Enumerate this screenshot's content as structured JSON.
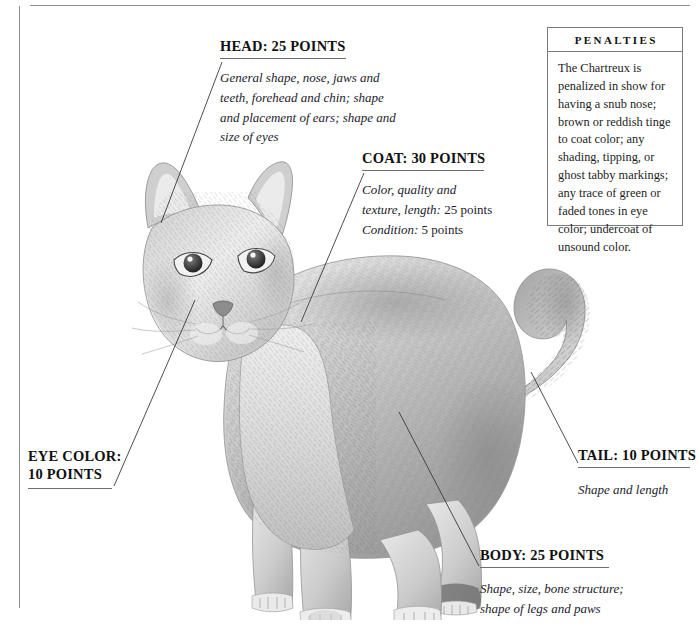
{
  "page": {
    "illustration_label": "chartreux-cat-drawing"
  },
  "callouts": [
    {
      "id": "head",
      "title": "HEAD: 25 POINTS",
      "body": "General shape, nose, jaws and teeth, forehead and chin; shape and placement of ears; shape and size of eyes"
    },
    {
      "id": "coat",
      "title": "COAT: 30 POINTS",
      "body_line1": "Color, quality and",
      "body_line2_italic": "texture, length:",
      "body_line2_upright": " 25 points",
      "body_line3_italic": "Condition:",
      "body_line3_upright": " 5 points"
    },
    {
      "id": "eye-color",
      "title_line1": "EYE COLOR:",
      "title_line2": "10 POINTS"
    },
    {
      "id": "tail",
      "title": "TAIL: 10 POINTS",
      "body": "Shape and length"
    },
    {
      "id": "body",
      "title": "BODY: 25 POINTS",
      "body_line1": "Shape, size, bone structure;",
      "body_line2": "shape of legs and paws"
    }
  ],
  "penalties": {
    "heading": "PENALTIES",
    "text": "The Chartreux is penalized in show for having a snub nose; brown or reddish tinge to coat color; any shading, tipping, or ghost tabby markings; any trace of green or faded tones in eye color; undercoat of unsound color."
  },
  "colors": {
    "rule": "#8e8e8e",
    "leader": "#3a3a3a",
    "text": "#1a1a1a",
    "panel_border": "#7b7b7b",
    "background": "#ffffff"
  }
}
